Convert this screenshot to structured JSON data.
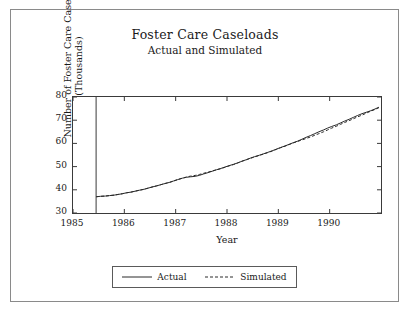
{
  "figure": {
    "title": "Foster Care Caseloads",
    "subtitle": "Actual and Simulated",
    "legend": {
      "items": [
        {
          "label": "Actual",
          "style": "solid",
          "color": "#2a2a2a"
        },
        {
          "label": "Simulated",
          "style": "dashed",
          "color": "#2a2a2a"
        }
      ]
    }
  },
  "chart_data": {
    "type": "line",
    "title": "Foster Care Caseloads",
    "subtitle": "Actual and Simulated",
    "xlabel": "Year",
    "ylabel": "Number of Foster Care Cases (Thousands)",
    "xlim": [
      1985.0,
      1991.0
    ],
    "ylim": [
      30,
      80
    ],
    "yticks": [
      30,
      40,
      50,
      60,
      70,
      80
    ],
    "xticks": [
      1985,
      1986,
      1987,
      1988,
      1989,
      1990
    ],
    "grid": false,
    "legend_position": "below-axes",
    "annotations": [
      {
        "type": "vline",
        "x": 1985.45,
        "label": ""
      }
    ],
    "series": [
      {
        "name": "Actual",
        "style": "solid",
        "color": "#2a2a2a",
        "x": [
          1985.45,
          1985.54,
          1985.63,
          1985.71,
          1985.8,
          1985.88,
          1985.96,
          1986.04,
          1986.13,
          1986.21,
          1986.29,
          1986.38,
          1986.46,
          1986.54,
          1986.63,
          1986.71,
          1986.79,
          1986.88,
          1986.96,
          1987.04,
          1987.13,
          1987.21,
          1987.29,
          1987.38,
          1987.46,
          1987.54,
          1987.63,
          1987.71,
          1987.79,
          1987.88,
          1987.96,
          1988.04,
          1988.13,
          1988.21,
          1988.29,
          1988.38,
          1988.46,
          1988.54,
          1988.63,
          1988.71,
          1988.79,
          1988.88,
          1988.96,
          1989.04,
          1989.13,
          1989.21,
          1989.29,
          1989.38,
          1989.46,
          1989.54,
          1989.63,
          1989.71,
          1989.79,
          1989.88,
          1989.96,
          1990.04,
          1990.13,
          1990.21,
          1990.29,
          1990.38,
          1990.46,
          1990.54,
          1990.63,
          1990.71,
          1990.79,
          1990.88,
          1990.96
        ],
        "y": [
          37.0,
          37.2,
          37.3,
          37.5,
          37.7,
          38.0,
          38.3,
          38.7,
          39.0,
          39.4,
          39.8,
          40.2,
          40.7,
          41.2,
          41.7,
          42.2,
          42.7,
          43.2,
          43.8,
          44.4,
          45.0,
          45.4,
          45.6,
          45.8,
          46.2,
          46.8,
          47.4,
          48.0,
          48.6,
          49.2,
          49.8,
          50.4,
          51.0,
          51.6,
          52.3,
          53.0,
          53.7,
          54.3,
          54.9,
          55.5,
          56.1,
          56.8,
          57.5,
          58.2,
          58.9,
          59.6,
          60.3,
          61.0,
          61.8,
          62.6,
          63.4,
          64.2,
          65.0,
          65.8,
          66.6,
          67.3,
          68.0,
          68.8,
          69.6,
          70.4,
          71.2,
          72.0,
          72.8,
          73.4,
          74.0,
          74.8,
          75.6
        ]
      },
      {
        "name": "Simulated",
        "style": "dashed",
        "color": "#2a2a2a",
        "x": [
          1985.45,
          1985.54,
          1985.63,
          1985.71,
          1985.8,
          1985.88,
          1985.96,
          1986.04,
          1986.13,
          1986.21,
          1986.29,
          1986.38,
          1986.46,
          1986.54,
          1986.63,
          1986.71,
          1986.79,
          1986.88,
          1986.96,
          1987.04,
          1987.13,
          1987.21,
          1987.29,
          1987.38,
          1987.46,
          1987.54,
          1987.63,
          1987.71,
          1987.79,
          1987.88,
          1987.96,
          1988.04,
          1988.13,
          1988.21,
          1988.29,
          1988.38,
          1988.46,
          1988.54,
          1988.63,
          1988.71,
          1988.79,
          1988.88,
          1988.96,
          1989.04,
          1989.13,
          1989.21,
          1989.29,
          1989.38,
          1989.46,
          1989.54,
          1989.63,
          1989.71,
          1989.79,
          1989.88,
          1989.96,
          1990.04,
          1990.13,
          1990.21,
          1990.29,
          1990.38,
          1990.46,
          1990.54,
          1990.63,
          1990.71,
          1990.79,
          1990.88,
          1990.96
        ],
        "y": [
          37.0,
          37.2,
          37.3,
          37.5,
          37.7,
          38.0,
          38.3,
          38.7,
          39.0,
          39.4,
          39.8,
          40.2,
          40.7,
          41.2,
          41.7,
          42.2,
          42.7,
          43.2,
          43.8,
          44.4,
          45.0,
          45.5,
          45.9,
          46.2,
          46.6,
          47.1,
          47.6,
          48.1,
          48.6,
          49.1,
          49.7,
          50.3,
          50.9,
          51.6,
          52.3,
          53.0,
          53.6,
          54.2,
          54.8,
          55.4,
          56.0,
          56.7,
          57.4,
          58.1,
          58.8,
          59.5,
          60.2,
          60.9,
          61.5,
          62.1,
          62.8,
          63.5,
          64.2,
          65.0,
          65.8,
          66.6,
          67.4,
          68.2,
          69.0,
          69.8,
          70.6,
          71.4,
          72.2,
          73.0,
          73.8,
          74.6,
          75.4
        ]
      }
    ]
  }
}
